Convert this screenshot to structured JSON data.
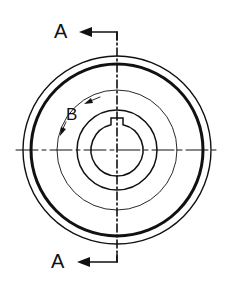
{
  "drawing": {
    "type": "engineering-section-view",
    "center": [
      117,
      150
    ],
    "stroke_color": "#111111",
    "circles": [
      {
        "name": "outer-rim",
        "r": 94,
        "stroke_width": 1.4
      },
      {
        "name": "rim-groove",
        "r": 86,
        "stroke_width": 3
      },
      {
        "name": "detail-circle",
        "r": 60,
        "stroke_width": 0.9
      },
      {
        "name": "hub",
        "r": 40,
        "stroke_width": 1.5
      },
      {
        "name": "bore",
        "r": 26,
        "stroke_width": 1.5
      }
    ],
    "section_label_top": "A",
    "section_label_bottom": "A",
    "detail_label": "B"
  }
}
